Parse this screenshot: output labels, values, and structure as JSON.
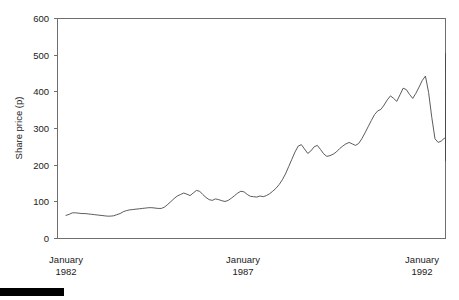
{
  "chart_data": {
    "type": "line",
    "title": "",
    "xlabel": "",
    "ylabel": "Share price (p)",
    "ylim": [
      0,
      600
    ],
    "yticks": [
      0,
      100,
      200,
      300,
      400,
      500,
      600
    ],
    "ytick_labels": [
      "0",
      "100",
      "200",
      "300",
      "400",
      "500",
      "600"
    ],
    "xtick_labels": [
      {
        "month": "January",
        "year": "1982"
      },
      {
        "month": "January",
        "year": "1987"
      },
      {
        "month": "January",
        "year": "1992"
      }
    ],
    "xlim_years": [
      1982.0,
      1992.25
    ],
    "grid": false,
    "legend": null,
    "line_color": "#4a4a4a",
    "axis_color": "#6f6f6f",
    "series": [
      {
        "name": "Share price",
        "x_start_year": 1982.0,
        "x_step_years": 0.08403,
        "units": "pence",
        "values": [
          63,
          66,
          70,
          70,
          69,
          68,
          68,
          67,
          66,
          65,
          64,
          63,
          62,
          61,
          61,
          62,
          65,
          68,
          73,
          76,
          78,
          79,
          80,
          81,
          82,
          83,
          84,
          84,
          83,
          82,
          82,
          86,
          93,
          101,
          109,
          116,
          120,
          124,
          121,
          117,
          124,
          131,
          129,
          120,
          112,
          106,
          104,
          108,
          106,
          103,
          101,
          104,
          110,
          117,
          124,
          129,
          127,
          120,
          115,
          114,
          113,
          116,
          114,
          117,
          122,
          129,
          137,
          147,
          160,
          176,
          196,
          216,
          236,
          252,
          256,
          244,
          232,
          239,
          250,
          254,
          243,
          231,
          224,
          226,
          230,
          236,
          245,
          252,
          258,
          262,
          258,
          254,
          259,
          272,
          288,
          305,
          322,
          338,
          348,
          352,
          364,
          378,
          389,
          382,
          374,
          392,
          410,
          406,
          393,
          382,
          396,
          413,
          431,
          443,
          398,
          330,
          272,
          262,
          266,
          274,
          271,
          265,
          264,
          267,
          272,
          282,
          296,
          310,
          322,
          305,
          290,
          284,
          288,
          277,
          264,
          252,
          240,
          230,
          221,
          214,
          212,
          219,
          232,
          244,
          250,
          248,
          252,
          262,
          272,
          284,
          296,
          308,
          318,
          324,
          314,
          304,
          300,
          309,
          318,
          312,
          303,
          308,
          318,
          325,
          318,
          308,
          303,
          312,
          306,
          318,
          340,
          360,
          372,
          364,
          344,
          322,
          308,
          300,
          295,
          306,
          318,
          327,
          325,
          330,
          348,
          368,
          386,
          396,
          392,
          404,
          428,
          452,
          474,
          492,
          496,
          482,
          470,
          478,
          492,
          505
        ]
      }
    ],
    "annotations": []
  },
  "figure": {
    "black_bar": {
      "name": "bottom-left-black-bar",
      "color": "#000000"
    }
  }
}
